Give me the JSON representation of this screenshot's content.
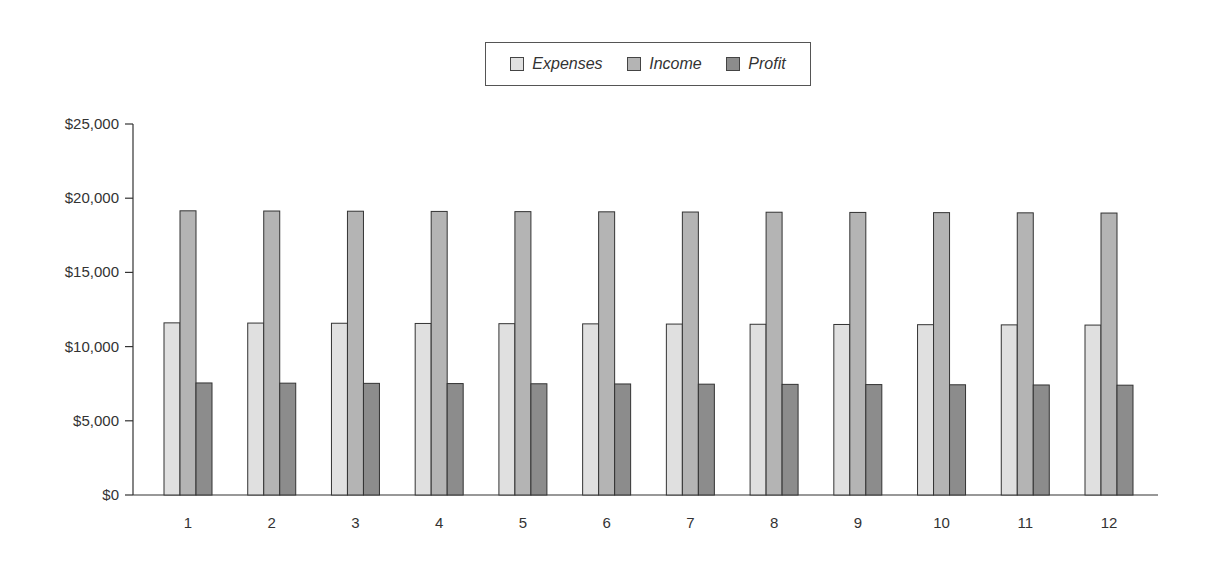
{
  "chart_data": {
    "type": "bar",
    "title": "",
    "xlabel": "",
    "ylabel": "",
    "categories": [
      "1",
      "2",
      "3",
      "4",
      "5",
      "6",
      "7",
      "8",
      "9",
      "10",
      "11",
      "12"
    ],
    "series": [
      {
        "name": "Expenses",
        "color": "#e0e0e0",
        "values": [
          11600,
          11586,
          11573,
          11559,
          11545,
          11532,
          11518,
          11505,
          11491,
          11477,
          11464,
          11450
        ]
      },
      {
        "name": "Income",
        "color": "#b4b4b4",
        "values": [
          19150,
          19136,
          19123,
          19109,
          19095,
          19082,
          19068,
          19055,
          19041,
          19027,
          19014,
          19000
        ]
      },
      {
        "name": "Profit",
        "color": "#8c8c8c",
        "values": [
          7550,
          7536,
          7523,
          7509,
          7495,
          7482,
          7468,
          7455,
          7441,
          7427,
          7414,
          7400
        ]
      }
    ],
    "ylim": [
      0,
      25000
    ],
    "yticks": [
      0,
      5000,
      10000,
      15000,
      20000,
      25000
    ],
    "ytick_labels": [
      "$0",
      "$5,000",
      "$10,000",
      "$15,000",
      "$20,000",
      "$25,000"
    ],
    "grid": false,
    "legend_position": "top-center"
  },
  "legend": {
    "items": [
      {
        "label": "Expenses",
        "color": "#e0e0e0"
      },
      {
        "label": "Income",
        "color": "#b4b4b4"
      },
      {
        "label": "Profit",
        "color": "#8c8c8c"
      }
    ]
  },
  "style": {
    "bar_border": "#333333",
    "axis_color": "#333333",
    "text_color": "#333333"
  }
}
